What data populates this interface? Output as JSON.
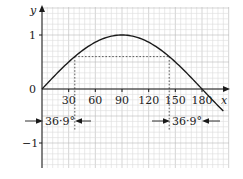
{
  "chart_data": {
    "type": "line",
    "title": "",
    "xlabel": "x",
    "ylabel": "y",
    "xlim": [
      0,
      210
    ],
    "ylim": [
      -1.45,
      1.5
    ],
    "grid": true,
    "x_ticks": [
      30,
      60,
      90,
      120,
      150,
      180
    ],
    "x_tick_labels": [
      "30",
      "60",
      "90",
      "120",
      "150",
      "180"
    ],
    "y_ticks": [
      1,
      0,
      -1
    ],
    "y_tick_labels": [
      "1",
      "0",
      "−1"
    ],
    "series": [
      {
        "name": "y = sin x",
        "function": "sin(x)",
        "x": [
          0,
          30,
          36.9,
          60,
          90,
          120,
          143.1,
          150,
          180,
          204
        ],
        "values": [
          0,
          0.5,
          0.6,
          0.866,
          1,
          0.866,
          0.6,
          0.5,
          0,
          -0.41
        ]
      }
    ],
    "annotations": [
      {
        "type": "hline-dotted",
        "y": 0.6,
        "x_from": 36.9,
        "x_to": 143.1
      },
      {
        "type": "vline-dotted",
        "x": 36.9
      },
      {
        "type": "vline-dotted",
        "x": 143.1
      },
      {
        "type": "span-label",
        "text": "36·9°",
        "from": 0,
        "to": 36.9
      },
      {
        "type": "span-label",
        "text": "36·9°",
        "from": 143.1,
        "to": 180
      }
    ]
  },
  "labels": {
    "y_axis": "y",
    "x_axis": "x",
    "y_one": "1",
    "y_zero": "0",
    "y_neg_one": "−1",
    "x30": "30",
    "x60": "60",
    "x90": "90",
    "x120": "120",
    "x150": "150",
    "x180": "180",
    "span_left": "36·9°",
    "span_right": "36·9°"
  },
  "colors": {
    "grid_minor": "#dcdcdc",
    "grid_major": "#b8b8b8",
    "curve": "#1a1a1a",
    "axis": "#1a1a1a"
  }
}
